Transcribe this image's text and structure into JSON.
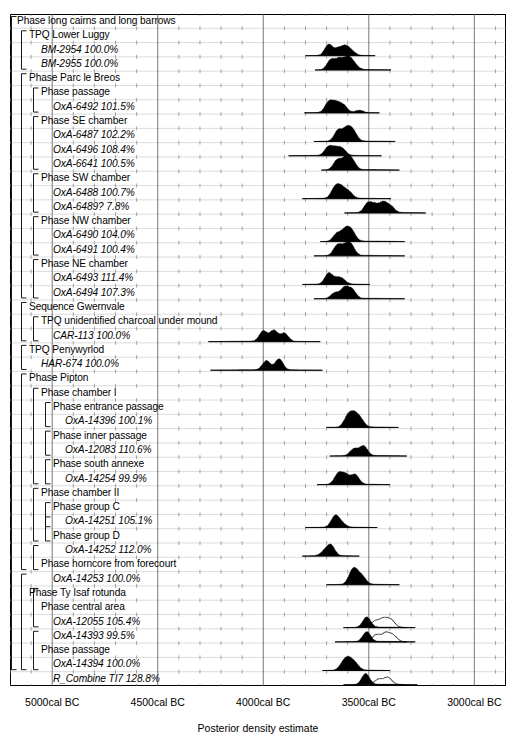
{
  "chart_data": {
    "type": "area",
    "title": "",
    "xlabel": "Posterior density estimate",
    "ylabel": "",
    "xlim": [
      -5200,
      -2850
    ],
    "x_unit": "cal BC",
    "grid": true,
    "legend": "none",
    "xticks": [
      {
        "value": -5000,
        "label": "5000cal BC"
      },
      {
        "value": -4500,
        "label": "4500cal BC"
      },
      {
        "value": -4000,
        "label": "4000cal BC"
      },
      {
        "value": -3500,
        "label": "3500cal BC"
      },
      {
        "value": -3000,
        "label": "3000cal BC"
      }
    ],
    "minor_tick_step": 100,
    "rows": [
      {
        "label": "Phase long cairns and long barrows",
        "kind": "phase",
        "indent": 0,
        "agreement": null,
        "dist": null
      },
      {
        "label": "TPQ Lower Luggy",
        "kind": "phase",
        "indent": 1,
        "agreement": null,
        "dist": null
      },
      {
        "label": "BM-2954",
        "kind": "date",
        "indent": 2,
        "agreement": "100.0%",
        "dist": {
          "range": [
            -3800,
            -3470
          ],
          "peaks": [
            [
              -3690,
              0.95
            ],
            [
              -3645,
              0.55
            ],
            [
              -3610,
              0.72
            ],
            [
              -3580,
              0.3
            ]
          ],
          "outline": null
        }
      },
      {
        "label": "BM-2955",
        "kind": "date",
        "indent": 2,
        "agreement": "100.0%",
        "dist": {
          "range": [
            -3755,
            -3395
          ],
          "peaks": [
            [
              -3680,
              0.85
            ],
            [
              -3640,
              0.9
            ],
            [
              -3600,
              1.0
            ],
            [
              -3570,
              0.45
            ]
          ],
          "outline": null
        }
      },
      {
        "label": "Phase Parc le Breos",
        "kind": "phase",
        "indent": 1,
        "agreement": null,
        "dist": null
      },
      {
        "label": "Phase passage",
        "kind": "phase",
        "indent": 2,
        "agreement": null,
        "dist": null
      },
      {
        "label": "OxA-6492",
        "kind": "date",
        "indent": 3,
        "agreement": "101.5%",
        "dist": {
          "range": [
            -3805,
            -3450
          ],
          "peaks": [
            [
              -3690,
              0.9
            ],
            [
              -3655,
              0.8
            ],
            [
              -3620,
              0.6
            ],
            [
              -3545,
              0.2
            ]
          ],
          "outline": null
        }
      },
      {
        "label": "Phase SE chamber",
        "kind": "phase",
        "indent": 2,
        "agreement": null,
        "dist": null
      },
      {
        "label": "OxA-6487",
        "kind": "date",
        "indent": 3,
        "agreement": "102.2%",
        "dist": {
          "range": [
            -3760,
            -3375
          ],
          "peaks": [
            [
              -3645,
              0.95
            ],
            [
              -3605,
              1.0
            ],
            [
              -3575,
              0.85
            ]
          ],
          "outline": null
        }
      },
      {
        "label": "OxA-6496",
        "kind": "date",
        "indent": 3,
        "agreement": "108.4%",
        "dist": {
          "range": [
            -3880,
            -3440
          ],
          "peaks": [
            [
              -3690,
              0.75
            ],
            [
              -3655,
              0.55
            ],
            [
              -3625,
              0.5
            ]
          ],
          "outline": null
        }
      },
      {
        "label": "OxA-6641",
        "kind": "date",
        "indent": 3,
        "agreement": "100.5%",
        "dist": {
          "range": [
            -3725,
            -3355
          ],
          "peaks": [
            [
              -3650,
              0.85
            ],
            [
              -3610,
              0.95
            ],
            [
              -3580,
              0.8
            ]
          ],
          "outline": null
        }
      },
      {
        "label": "Phase SW chamber",
        "kind": "phase",
        "indent": 2,
        "agreement": null,
        "dist": null
      },
      {
        "label": "OxA-6488",
        "kind": "date",
        "indent": 3,
        "agreement": "100.7%",
        "dist": {
          "range": [
            -3815,
            -3395
          ],
          "peaks": [
            [
              -3660,
              0.9
            ],
            [
              -3630,
              0.85
            ],
            [
              -3595,
              0.55
            ]
          ],
          "outline": null
        }
      },
      {
        "label": "OxA-6489?",
        "kind": "date",
        "indent": 3,
        "agreement": "7.8%",
        "dist": {
          "range": [
            -3615,
            -3230
          ],
          "peaks": [
            [
              -3505,
              0.8
            ],
            [
              -3470,
              0.65
            ],
            [
              -3430,
              0.85
            ],
            [
              -3395,
              0.5
            ]
          ],
          "outline": null
        }
      },
      {
        "label": "Phase NW chamber",
        "kind": "phase",
        "indent": 2,
        "agreement": null,
        "dist": null
      },
      {
        "label": "OxA-6490",
        "kind": "date",
        "indent": 3,
        "agreement": "104.0%",
        "dist": {
          "range": [
            -3730,
            -3330
          ],
          "peaks": [
            [
              -3650,
              0.7
            ],
            [
              -3610,
              1.0
            ],
            [
              -3580,
              0.8
            ]
          ],
          "outline": null
        }
      },
      {
        "label": "OxA-6491",
        "kind": "date",
        "indent": 3,
        "agreement": "100.4%",
        "dist": {
          "range": [
            -3760,
            -3330
          ],
          "peaks": [
            [
              -3650,
              0.85
            ],
            [
              -3615,
              0.7
            ],
            [
              -3585,
              0.9
            ]
          ],
          "outline": null
        }
      },
      {
        "label": "Phase NE chamber",
        "kind": "phase",
        "indent": 2,
        "agreement": null,
        "dist": null
      },
      {
        "label": "OxA-6493",
        "kind": "date",
        "indent": 3,
        "agreement": "111.4%",
        "dist": {
          "range": [
            -3815,
            -3495
          ],
          "peaks": [
            [
              -3690,
              0.95
            ],
            [
              -3650,
              0.4
            ],
            [
              -3625,
              0.35
            ]
          ],
          "outline": null
        }
      },
      {
        "label": "OxA-6494",
        "kind": "date",
        "indent": 3,
        "agreement": "107.3%",
        "dist": {
          "range": [
            -3760,
            -3330
          ],
          "peaks": [
            [
              -3660,
              0.5
            ],
            [
              -3615,
              0.9
            ],
            [
              -3580,
              0.75
            ]
          ],
          "outline": null
        }
      },
      {
        "label": "Sequence Gwernvale",
        "kind": "phase",
        "indent": 1,
        "agreement": null,
        "dist": null
      },
      {
        "label": "TPQ unidentified charcoal under mound",
        "kind": "phase",
        "indent": 2,
        "agreement": null,
        "dist": null
      },
      {
        "label": "CAR-113",
        "kind": "date",
        "indent": 3,
        "agreement": "100.0%",
        "dist": {
          "range": [
            -4260,
            -3730
          ],
          "peaks": [
            [
              -4000,
              0.9
            ],
            [
              -3950,
              0.95
            ],
            [
              -3900,
              0.7
            ]
          ],
          "outline": null
        }
      },
      {
        "label": "TPQ Penywyrlod",
        "kind": "phase",
        "indent": 1,
        "agreement": null,
        "dist": null
      },
      {
        "label": "HAR-674",
        "kind": "date",
        "indent": 2,
        "agreement": "100.0%",
        "dist": {
          "range": [
            -4250,
            -3720
          ],
          "peaks": [
            [
              -3985,
              0.8
            ],
            [
              -3925,
              0.95
            ]
          ],
          "outline": null
        }
      },
      {
        "label": "Phase Pipton",
        "kind": "phase",
        "indent": 1,
        "agreement": null,
        "dist": null
      },
      {
        "label": "Phase chamber I",
        "kind": "phase",
        "indent": 2,
        "agreement": null,
        "dist": null
      },
      {
        "label": "Phase entrance passage",
        "kind": "phase",
        "indent": 3,
        "agreement": null,
        "dist": null
      },
      {
        "label": "OxA-14396",
        "kind": "date",
        "indent": 4,
        "agreement": "100.1%",
        "dist": {
          "range": [
            -3700,
            -3360
          ],
          "peaks": [
            [
              -3600,
              0.9
            ],
            [
              -3570,
              1.0
            ],
            [
              -3540,
              0.65
            ]
          ],
          "outline": null
        }
      },
      {
        "label": "Phase inner passage",
        "kind": "phase",
        "indent": 3,
        "agreement": null,
        "dist": null
      },
      {
        "label": "OxA-12083",
        "kind": "date",
        "indent": 4,
        "agreement": "110.6%",
        "dist": {
          "range": [
            -3685,
            -3320
          ],
          "peaks": [
            [
              -3570,
              0.6
            ],
            [
              -3525,
              0.85
            ]
          ],
          "outline": null
        }
      },
      {
        "label": "Phase south annexe",
        "kind": "phase",
        "indent": 3,
        "agreement": null,
        "dist": null
      },
      {
        "label": "OxA-14254",
        "kind": "date",
        "indent": 4,
        "agreement": "99.9%",
        "dist": {
          "range": [
            -3745,
            -3400
          ],
          "peaks": [
            [
              -3645,
              0.9
            ],
            [
              -3610,
              0.8
            ],
            [
              -3565,
              0.85
            ]
          ],
          "outline": null
        }
      },
      {
        "label": "Phase chamber II",
        "kind": "phase",
        "indent": 2,
        "agreement": null,
        "dist": null
      },
      {
        "label": "Phase group C",
        "kind": "phase",
        "indent": 3,
        "agreement": null,
        "dist": null
      },
      {
        "label": "OxA-14251",
        "kind": "date",
        "indent": 4,
        "agreement": "105.1%",
        "dist": {
          "range": [
            -3800,
            -3460
          ],
          "peaks": [
            [
              -3660,
              0.95
            ],
            [
              -3630,
              0.35
            ]
          ],
          "outline": null
        }
      },
      {
        "label": "Phase group D",
        "kind": "phase",
        "indent": 3,
        "agreement": null,
        "dist": null
      },
      {
        "label": "OxA-14252",
        "kind": "date",
        "indent": 4,
        "agreement": "112.0%",
        "dist": {
          "range": [
            -3815,
            -3545
          ],
          "peaks": [
            [
              -3680,
              0.9
            ],
            [
              -3710,
              0.35
            ]
          ],
          "outline": null
        }
      },
      {
        "label": "Phase horncore from forecourt",
        "kind": "phase",
        "indent": 2,
        "agreement": null,
        "dist": null
      },
      {
        "label": "OxA-14253",
        "kind": "date",
        "indent": 3,
        "agreement": "100.0%",
        "dist": {
          "range": [
            -3700,
            -3355
          ],
          "peaks": [
            [
              -3580,
              0.9
            ],
            [
              -3560,
              0.75
            ],
            [
              -3530,
              0.6
            ]
          ],
          "outline": null
        }
      },
      {
        "label": "Phase Ty Isaf rotunda",
        "kind": "phase",
        "indent": 1,
        "agreement": null,
        "dist": null
      },
      {
        "label": "Phase central area",
        "kind": "phase",
        "indent": 2,
        "agreement": null,
        "dist": null
      },
      {
        "label": "OxA-12055",
        "kind": "date",
        "indent": 3,
        "agreement": "105.4%",
        "dist": {
          "range": [
            -3620,
            -3280
          ],
          "peaks": [
            [
              -3510,
              0.9
            ]
          ],
          "outline": {
            "range": [
              -3500,
              -3320
            ],
            "peaks": [
              [
                -3470,
                0.55
              ],
              [
                -3430,
                0.7
              ],
              [
                -3395,
                0.6
              ]
            ]
          }
        }
      },
      {
        "label": "OxA-14393",
        "kind": "date",
        "indent": 3,
        "agreement": "99.5%",
        "dist": {
          "range": [
            -3660,
            -3280
          ],
          "peaks": [
            [
              -3510,
              0.85
            ]
          ],
          "outline": {
            "range": [
              -3500,
              -3320
            ],
            "peaks": [
              [
                -3465,
                0.6
              ],
              [
                -3420,
                0.7
              ],
              [
                -3385,
                0.5
              ]
            ]
          }
        }
      },
      {
        "label": "Phase passage",
        "kind": "phase",
        "indent": 2,
        "agreement": null,
        "dist": null
      },
      {
        "label": "OxA-14394",
        "kind": "date",
        "indent": 3,
        "agreement": "100.0%",
        "dist": {
          "range": [
            -3720,
            -3400
          ],
          "peaks": [
            [
              -3620,
              0.6
            ],
            [
              -3595,
              0.8
            ],
            [
              -3565,
              0.55
            ]
          ],
          "outline": null
        }
      },
      {
        "label": "R_Combine TI7",
        "kind": "date",
        "indent": 3,
        "agreement": "128.8%",
        "dist": {
          "range": [
            -3620,
            -3270
          ],
          "peaks": [
            [
              -3515,
              0.95
            ]
          ],
          "outline": {
            "range": [
              -3490,
              -3330
            ],
            "peaks": [
              [
                -3455,
                0.45
              ],
              [
                -3410,
                0.6
              ]
            ]
          }
        }
      }
    ],
    "brackets": [
      {
        "level": 0,
        "start": 0,
        "end": 45
      },
      {
        "level": 1,
        "start": 1,
        "end": 3
      },
      {
        "level": 1,
        "start": 4,
        "end": 19
      },
      {
        "level": 2,
        "start": 5,
        "end": 6
      },
      {
        "level": 2,
        "start": 7,
        "end": 10
      },
      {
        "level": 2,
        "start": 11,
        "end": 13
      },
      {
        "level": 2,
        "start": 14,
        "end": 16
      },
      {
        "level": 2,
        "start": 17,
        "end": 19
      },
      {
        "level": 1,
        "start": 20,
        "end": 22
      },
      {
        "level": 2,
        "start": 21,
        "end": 22
      },
      {
        "level": 1,
        "start": 23,
        "end": 24
      },
      {
        "level": 1,
        "start": 25,
        "end": 38
      },
      {
        "level": 2,
        "start": 26,
        "end": 32
      },
      {
        "level": 3,
        "start": 27,
        "end": 28
      },
      {
        "level": 3,
        "start": 29,
        "end": 30
      },
      {
        "level": 3,
        "start": 31,
        "end": 32
      },
      {
        "level": 2,
        "start": 33,
        "end": 36
      },
      {
        "level": 3,
        "start": 34,
        "end": 35
      },
      {
        "level": 3,
        "start": 35,
        "end": 36
      },
      {
        "level": 2,
        "start": 37,
        "end": 38
      },
      {
        "level": 1,
        "start": 39,
        "end": 45
      },
      {
        "level": 2,
        "start": 40,
        "end": 42
      },
      {
        "level": 2,
        "start": 43,
        "end": 45
      }
    ]
  },
  "axis": {
    "title": "Posterior density estimate"
  }
}
